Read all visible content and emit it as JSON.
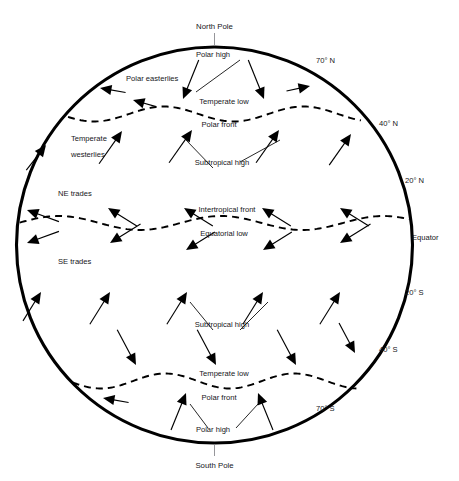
{
  "figure": {
    "type": "diagram",
    "background_color": "#ffffff",
    "outline_color": "#000000",
    "latitude_line_color": "#6e6e72",
    "front_color": "#000000",
    "text_color": "#16161a"
  },
  "poles": {
    "north": "North Pole",
    "south": "South Pole"
  },
  "latitude_labels": [
    {
      "id": "lat-70n",
      "text": "70° N",
      "x": 316,
      "y": 63,
      "line_y": 72,
      "line_x1": 92,
      "line_x2": 340
    },
    {
      "id": "lat-40n",
      "text": "40° N",
      "x": 379,
      "y": 126,
      "line_y": 134,
      "line_x1": 36,
      "line_x2": 396
    },
    {
      "id": "lat-20n",
      "text": "20° N",
      "x": 405,
      "y": 183,
      "line_y": 190,
      "line_x1": 23,
      "line_x2": 408
    },
    {
      "id": "lat-eq",
      "text": "Equator",
      "x": 412,
      "y": 240,
      "line_y": 245,
      "line_x1": 17,
      "line_x2": 413
    },
    {
      "id": "lat-20s",
      "text": "20° S",
      "x": 405,
      "y": 295,
      "line_y": 300,
      "line_x1": 23,
      "line_x2": 408
    },
    {
      "id": "lat-40s",
      "text": "40° S",
      "x": 379,
      "y": 352,
      "line_y": 356,
      "line_x1": 36,
      "line_x2": 396
    },
    {
      "id": "lat-70s",
      "text": "70° S",
      "x": 316,
      "y": 411,
      "line_y": 417,
      "line_x1": 92,
      "line_x2": 340
    }
  ],
  "pressure_belts": [
    {
      "id": "polar-high-n",
      "text": "Polar high",
      "x": 213,
      "y": 57
    },
    {
      "id": "temperate-low-n",
      "text": "Temperate low",
      "x": 224,
      "y": 104
    },
    {
      "id": "polar-front-n",
      "text": "Polar front",
      "x": 219,
      "y": 127
    },
    {
      "id": "subtropical-high-n",
      "text": "Subtropical high",
      "x": 222,
      "y": 165
    },
    {
      "id": "intertropical-front",
      "text": "Intertropical front",
      "x": 227,
      "y": 212
    },
    {
      "id": "equatorial-low",
      "text": "Equatorial low",
      "x": 224,
      "y": 236
    },
    {
      "id": "subtropical-high-s",
      "text": "Subtropical high",
      "x": 222,
      "y": 327
    },
    {
      "id": "temperate-low-s",
      "text": "Temperate low",
      "x": 224,
      "y": 376
    },
    {
      "id": "polar-front-s",
      "text": "Polar front",
      "x": 219,
      "y": 400
    },
    {
      "id": "polar-high-s",
      "text": "Polar high",
      "x": 213,
      "y": 432
    }
  ],
  "wind_belts": [
    {
      "id": "polar-easterlies-n",
      "text": "Polar easterlies",
      "x": 126,
      "y": 81
    },
    {
      "id": "temperate-westerlies-line1",
      "text": "Temperate",
      "x": 71,
      "y": 141
    },
    {
      "id": "temperate-westerlies-line2",
      "text": "westerlies",
      "x": 71,
      "y": 157
    },
    {
      "id": "ne-trades",
      "text": "NE trades",
      "x": 58,
      "y": 196
    },
    {
      "id": "se-trades",
      "text": "SE trades",
      "x": 58,
      "y": 264
    }
  ],
  "fronts": [
    {
      "id": "polar-front-north-wave",
      "label": "Polar front",
      "style": "dashed",
      "y_center": 114
    },
    {
      "id": "intertropical-front-wave",
      "label": "Intertropical front",
      "style": "dashed",
      "y_center": 223
    },
    {
      "id": "polar-front-south-wave",
      "label": "Polar front",
      "style": "dashed",
      "y_center": 381
    }
  ],
  "globe": {
    "center_x": 214.5,
    "center_y": 245,
    "radius": 198,
    "stroke_width": 3.1
  },
  "wind_rows": [
    {
      "id": "polar-easterlies-north",
      "direction": "down-left",
      "belt": "Polar easterlies",
      "y": 88,
      "count": 3
    },
    {
      "id": "polar-high-outflow-north",
      "direction": "down-right",
      "belt": "Polar high outflow",
      "y": 92,
      "count": 2
    },
    {
      "id": "westerlies-north",
      "direction": "up-right",
      "belt": "Temperate westerlies",
      "y": 136,
      "count": 5
    },
    {
      "id": "ne-trades-row",
      "direction": "down-left",
      "belt": "NE trades",
      "y": 207,
      "count": 5
    },
    {
      "id": "se-trades-row",
      "direction": "up-left",
      "belt": "SE trades",
      "y": 250,
      "count": 5
    },
    {
      "id": "westerlies-south",
      "direction": "up-right",
      "belt": "Southern westerlies",
      "y": 296,
      "count": 5
    },
    {
      "id": "westerlies-south-2",
      "direction": "down-right",
      "belt": "Southern westerlies",
      "y": 358,
      "count": 4
    },
    {
      "id": "polar-easterlies-south",
      "direction": "up-right",
      "belt": "Polar easterlies",
      "y": 404,
      "count": 2
    }
  ]
}
